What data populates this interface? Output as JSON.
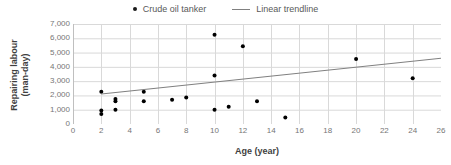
{
  "chart_data": {
    "type": "scatter",
    "title": "",
    "xlabel": "Age (year)",
    "ylabel": "Repairing labour (man-day)",
    "ylabel_line1": "Repairing labour",
    "ylabel_line2": "(man-day)",
    "xlim": [
      0,
      26
    ],
    "ylim": [
      0,
      7000
    ],
    "xticks": [
      0,
      2,
      4,
      6,
      8,
      10,
      12,
      14,
      16,
      18,
      20,
      22,
      24,
      26
    ],
    "xtick_labels": [
      "0",
      "2",
      "4",
      "6",
      "8",
      "10",
      "12",
      "14",
      "16",
      "18",
      "20",
      "22",
      "24",
      "26"
    ],
    "yticks": [
      0,
      1000,
      2000,
      3000,
      4000,
      5000,
      6000,
      7000
    ],
    "ytick_labels": [
      "0",
      "1,000",
      "2,000",
      "3,000",
      "4,000",
      "5,000",
      "6,000",
      "7,000"
    ],
    "grid": true,
    "grid_x": true,
    "grid_y": true,
    "legend_position": "top-center",
    "series": [
      {
        "name": "Crude oil tanker",
        "type": "scatter",
        "marker": "filled-circle",
        "color": "#000000",
        "points": [
          {
            "x": 2,
            "y": 2250
          },
          {
            "x": 2,
            "y": 950
          },
          {
            "x": 2,
            "y": 700
          },
          {
            "x": 3,
            "y": 1750
          },
          {
            "x": 3,
            "y": 1600
          },
          {
            "x": 3,
            "y": 1000
          },
          {
            "x": 5,
            "y": 2250
          },
          {
            "x": 5,
            "y": 1600
          },
          {
            "x": 7,
            "y": 1700
          },
          {
            "x": 8,
            "y": 1850
          },
          {
            "x": 10,
            "y": 6250
          },
          {
            "x": 10,
            "y": 3400
          },
          {
            "x": 10,
            "y": 1000
          },
          {
            "x": 11,
            "y": 1200
          },
          {
            "x": 12,
            "y": 5450
          },
          {
            "x": 13,
            "y": 1600
          },
          {
            "x": 15,
            "y": 450
          },
          {
            "x": 20,
            "y": 4550
          },
          {
            "x": 24,
            "y": 3200
          }
        ]
      },
      {
        "name": "Linear trendline",
        "type": "line",
        "color": "#808080",
        "points": [
          {
            "x": 2,
            "y": 2100
          },
          {
            "x": 26,
            "y": 4600
          }
        ]
      }
    ],
    "colors": {
      "marker": "#000000",
      "trendline": "#808080",
      "grid": "#d9d9d9",
      "axis": "#bfbfbf",
      "tick_text": "#767676",
      "axis_title": "#3f3f3f",
      "legend_text": "#595959",
      "background": "#ffffff"
    }
  },
  "legend": {
    "entries": [
      {
        "label": "Crude oil tanker",
        "marker": "dot-marker-icon"
      },
      {
        "label": "Linear trendline",
        "marker": "line-marker-icon"
      }
    ]
  }
}
